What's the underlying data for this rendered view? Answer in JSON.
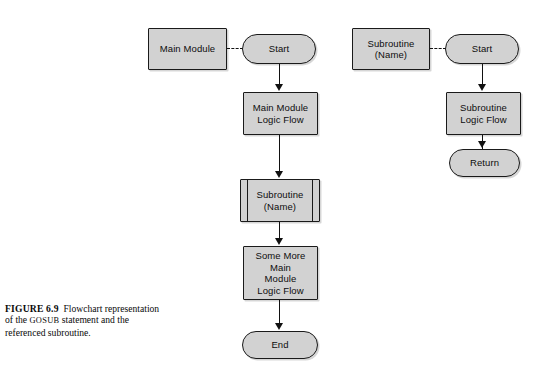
{
  "figure": {
    "caption_label": "FIGURE 6.9",
    "caption_text_a": "Flowchart representation of the ",
    "caption_gosub": "GOSUB",
    "caption_text_b": " statement and the referenced subroutine."
  },
  "colors": {
    "shape_fill": "#d2d2d2",
    "shape_stroke": "#1a1a1a",
    "connector": "#111111",
    "background": "#ffffff",
    "text": "#0d0d0d"
  },
  "flowchart": {
    "main_column": {
      "title": "Main Module",
      "nodes": [
        {
          "id": "main-module-label",
          "shape": "rect",
          "text": "Main Module"
        },
        {
          "id": "main-start",
          "shape": "stadium",
          "text": "Start"
        },
        {
          "id": "main-logic-flow",
          "shape": "rect",
          "text": "Main Module\nLogic Flow"
        },
        {
          "id": "subroutine-call",
          "shape": "predefined-process",
          "text": "Subroutine\n(Name)"
        },
        {
          "id": "more-main-logic",
          "shape": "rect",
          "text": "Some More\nMain\nModule\nLogic Flow"
        },
        {
          "id": "main-end",
          "shape": "stadium",
          "text": "End"
        }
      ]
    },
    "subroutine_column": {
      "title": "Subroutine (Name)",
      "nodes": [
        {
          "id": "subroutine-name-label",
          "shape": "rect",
          "text": "Subroutine\n(Name)"
        },
        {
          "id": "sub-start",
          "shape": "stadium",
          "text": "Start"
        },
        {
          "id": "sub-logic-flow",
          "shape": "rect",
          "text": "Subroutine\nLogic Flow"
        },
        {
          "id": "sub-return",
          "shape": "stadium",
          "text": "Return"
        }
      ]
    }
  }
}
